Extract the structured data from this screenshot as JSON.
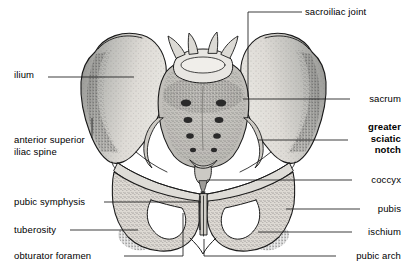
{
  "figure": {
    "type": "anatomical-line-drawing",
    "background_color": "#ffffff",
    "line_color": "#1a1a1a",
    "bone_fill_color": "#d9d9d6",
    "bone_fill_light": "#e6e5e2",
    "shadow_stipple_color": "#555555"
  },
  "labels": [
    {
      "id": "sacroiliac-joint",
      "text": "sacroiliac joint",
      "side": "right",
      "bold": false,
      "x": 305,
      "y": 9
    },
    {
      "id": "sacrum",
      "text": "sacrum",
      "side": "right",
      "bold": false,
      "x": 352,
      "y": 96
    },
    {
      "id": "greater-sciatic-notch",
      "text": "greater\nsciatic\nnotch",
      "line1": "greater",
      "line2": "sciatic",
      "line3": "notch",
      "side": "right",
      "bold": true,
      "x": 352,
      "y": 125
    },
    {
      "id": "coccyx",
      "text": "coccyx",
      "side": "right",
      "bold": false,
      "x": 355,
      "y": 177
    },
    {
      "id": "pubis",
      "text": "pubis",
      "side": "right",
      "bold": false,
      "x": 363,
      "y": 206
    },
    {
      "id": "ischium",
      "text": "ischium",
      "side": "right",
      "bold": false,
      "x": 355,
      "y": 229
    },
    {
      "id": "pubic-arch",
      "text": "pubic arch",
      "side": "right",
      "bold": false,
      "x": 339,
      "y": 253
    },
    {
      "id": "ilium",
      "text": "ilium",
      "side": "left",
      "bold": false,
      "x": 14,
      "y": 74
    },
    {
      "id": "anterior-superior-iliac-spine",
      "text": "anterior superior\niliac spine",
      "line1": "anterior superior",
      "line2": "iliac spine",
      "side": "left",
      "bold": false,
      "x": 14,
      "y": 140
    },
    {
      "id": "pubic-symphysis",
      "text": "pubic symphysis",
      "side": "left",
      "bold": false,
      "x": 14,
      "y": 199
    },
    {
      "id": "tuberosity",
      "text": "tuberosity",
      "side": "left",
      "bold": false,
      "x": 14,
      "y": 227
    },
    {
      "id": "obturator-foramen",
      "text": "obturator foramen",
      "side": "left",
      "bold": false,
      "x": 14,
      "y": 253
    }
  ],
  "structures": [
    "left ilium",
    "right ilium",
    "sacrum",
    "coccyx",
    "left pubis",
    "right pubis",
    "left ischium",
    "right ischium",
    "left obturator foramen",
    "right obturator foramen",
    "pubic symphysis",
    "fifth lumbar vertebra"
  ]
}
